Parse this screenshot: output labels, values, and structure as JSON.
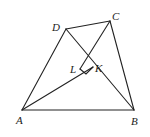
{
  "diagram": {
    "type": "geometry-figure",
    "points": {
      "A": {
        "label": "A",
        "x": 22,
        "y": 110
      },
      "B": {
        "label": "B",
        "x": 134,
        "y": 110
      },
      "C": {
        "label": "C",
        "x": 110,
        "y": 21
      },
      "D": {
        "label": "D",
        "x": 66,
        "y": 29
      },
      "L": {
        "label": "L",
        "x": 80,
        "y": 69
      },
      "K": {
        "label": "K",
        "x": 93,
        "y": 67
      }
    },
    "segments": [
      [
        "A",
        "B"
      ],
      [
        "A",
        "D"
      ],
      [
        "D",
        "C"
      ],
      [
        "C",
        "B"
      ],
      [
        "D",
        "B"
      ],
      [
        "C",
        "L"
      ],
      [
        "A",
        "K"
      ]
    ],
    "right_angle_mark": "at intersection near L and K",
    "colors": {
      "stroke": "#222222",
      "background": "#ffffff"
    }
  }
}
